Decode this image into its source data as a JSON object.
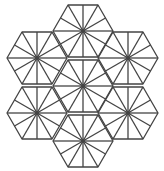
{
  "figure": {
    "title": "",
    "stroke_color": "#444444",
    "background": "#ffffff",
    "stroke_width": 1.3,
    "hex_radius": 30,
    "spokes_per_hex": 12,
    "hexagons": [
      {
        "name": "top",
        "cx": 83,
        "cy": 31
      },
      {
        "name": "upper-left",
        "cx": 37,
        "cy": 58
      },
      {
        "name": "upper-right",
        "cx": 128,
        "cy": 58
      },
      {
        "name": "center",
        "cx": 83,
        "cy": 86
      },
      {
        "name": "lower-left",
        "cx": 37,
        "cy": 113
      },
      {
        "name": "lower-right",
        "cx": 128,
        "cy": 113
      },
      {
        "name": "bottom",
        "cx": 83,
        "cy": 141
      }
    ]
  }
}
